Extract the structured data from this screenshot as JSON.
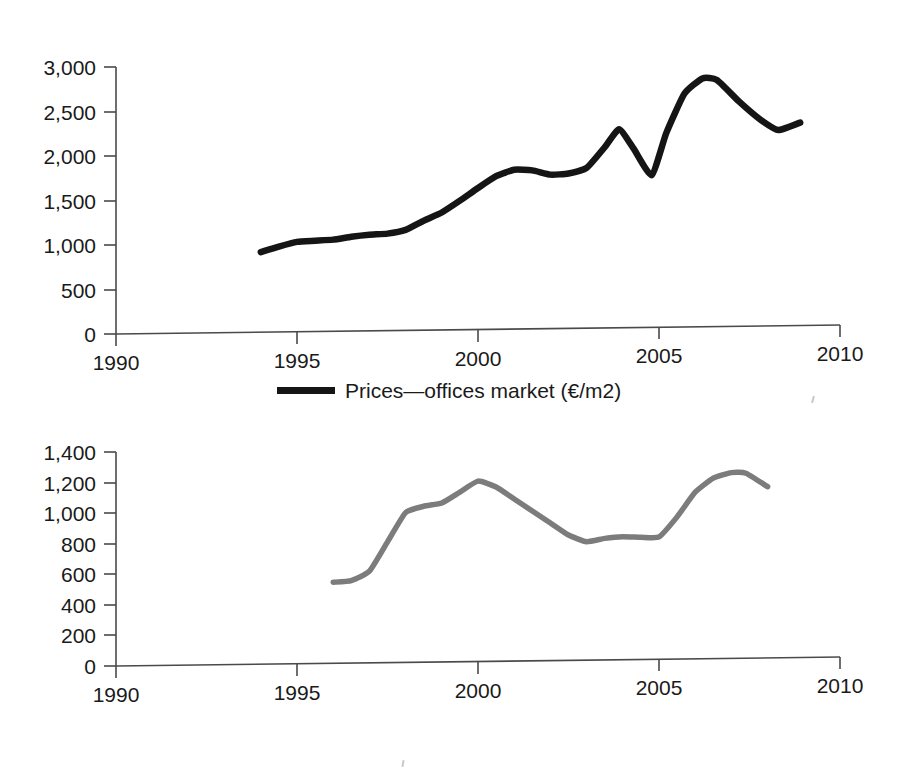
{
  "figure": {
    "background_color": "#ffffff",
    "panels": [
      {
        "id": "prices-offices-market",
        "legend_label": "Prices—offices market (€/m2)",
        "legend_swatch": "dark-line-swatch",
        "series_color": "#151515"
      },
      {
        "id": "amount-of-transactions-offices-market",
        "legend_label": "Amount of transactions—offices market",
        "legend_swatch": "gray-line-swatch",
        "series_color": "#7c7c7c"
      }
    ]
  },
  "chart_data": [
    {
      "type": "line",
      "title": "",
      "subtitle": "",
      "xlabel": "",
      "ylabel": "",
      "legend": [
        "Prices—offices market (€/m2)"
      ],
      "legend_position": "below-axis-centered",
      "grid": false,
      "xlim": [
        1990,
        2010
      ],
      "ylim": [
        0,
        3000
      ],
      "xticks": [
        1990,
        1995,
        2000,
        2005,
        2010
      ],
      "xticklabels": [
        "1990",
        "1995",
        "2000",
        "2005",
        "2010"
      ],
      "yticks": [
        0,
        500,
        1000,
        1500,
        2000,
        2500,
        3000
      ],
      "yticklabels": [
        "0",
        "500",
        "1,000",
        "1,500",
        "2,000",
        "2,500",
        "3,000"
      ],
      "series": [
        {
          "name": "Prices—offices market (€/m2)",
          "color": "#151515",
          "x": [
            1994.0,
            1994.5,
            1995.0,
            1995.5,
            1996.0,
            1996.5,
            1997.0,
            1997.5,
            1998.0,
            1998.5,
            1999.0,
            1999.5,
            2000.0,
            2000.5,
            2001.0,
            2001.5,
            2002.0,
            2002.5,
            2003.0,
            2003.5,
            2003.9,
            2004.3,
            2004.8,
            2005.2,
            2005.7,
            2006.2,
            2006.6,
            2007.2,
            2007.8,
            2008.3,
            2008.9
          ],
          "values": [
            900,
            960,
            1010,
            1020,
            1030,
            1060,
            1080,
            1090,
            1130,
            1230,
            1320,
            1450,
            1590,
            1720,
            1790,
            1780,
            1730,
            1740,
            1800,
            2030,
            2230,
            2010,
            1710,
            2180,
            2620,
            2790,
            2770,
            2530,
            2320,
            2200,
            2280
          ]
        }
      ]
    },
    {
      "type": "line",
      "title": "",
      "subtitle": "",
      "xlabel": "",
      "ylabel": "",
      "legend": [
        "Amount of transactions—offices market"
      ],
      "legend_position": "below-axis-centered",
      "grid": false,
      "xlim": [
        1990,
        2010
      ],
      "ylim": [
        0,
        1400
      ],
      "xticks": [
        1990,
        1995,
        2000,
        2005,
        2010
      ],
      "xticklabels": [
        "1990",
        "1995",
        "2000",
        "2005",
        "2010"
      ],
      "yticks": [
        0,
        200,
        400,
        600,
        800,
        1000,
        1200,
        1400
      ],
      "yticklabels": [
        "0",
        "200",
        "400",
        "600",
        "800",
        "1,000",
        "1,200",
        "1,400"
      ],
      "series": [
        {
          "name": "Amount of transactions—offices market",
          "color": "#7c7c7c",
          "x": [
            1996.0,
            1996.5,
            1997.0,
            1997.5,
            1998.0,
            1998.5,
            1999.0,
            1999.5,
            2000.0,
            2000.5,
            2001.0,
            2001.5,
            2002.0,
            2002.5,
            2003.0,
            2003.5,
            2004.0,
            2004.5,
            2005.0,
            2005.5,
            2006.0,
            2006.5,
            2007.0,
            2007.4,
            2008.0
          ],
          "values": [
            530,
            540,
            600,
            790,
            980,
            1020,
            1040,
            1110,
            1180,
            1140,
            1060,
            980,
            900,
            820,
            775,
            795,
            805,
            800,
            800,
            930,
            1090,
            1180,
            1215,
            1210,
            1120
          ]
        }
      ]
    }
  ]
}
